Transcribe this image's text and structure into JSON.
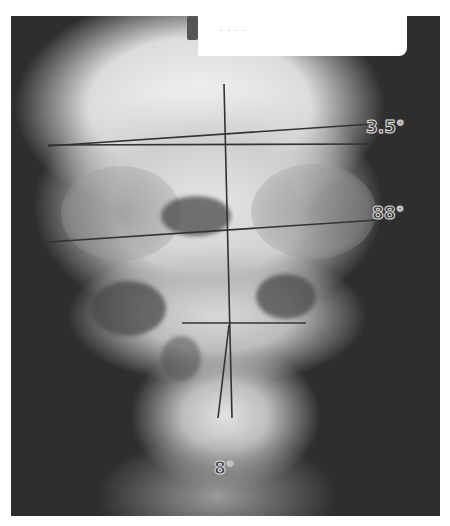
{
  "image": {
    "subject": "frontal skull x-ray with cephalometric reference lines",
    "label_card_text": "- - - -"
  },
  "angles": [
    {
      "id": "upper",
      "label": "3.5°"
    },
    {
      "id": "middle",
      "label": "88°"
    },
    {
      "id": "lower",
      "label": "8°"
    }
  ],
  "colors": {
    "background": "#ffffff",
    "film_dark": "#2e2e2e",
    "bone_light": "#e6e6e6",
    "line": "#333333",
    "angle_text_outline": "#d8d8d8"
  }
}
